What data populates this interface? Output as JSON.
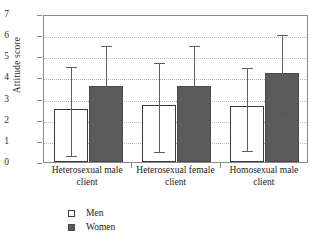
{
  "chart_data": {
    "type": "bar",
    "title": "",
    "xlabel": "",
    "ylabel": "Attitude score",
    "ylim": [
      0,
      7
    ],
    "yticks": [
      0,
      1,
      2,
      3,
      4,
      5,
      6,
      7
    ],
    "grid": true,
    "legend_position": "bottom-left",
    "error_bar_style": "capped-vertical",
    "categories": [
      "Heterosexual male client",
      "Heterosexual female client",
      "Homosexual male client"
    ],
    "series": [
      {
        "name": "Men",
        "color": "#ffffff",
        "values": [
          2.5,
          2.7,
          2.65
        ],
        "err_low": [
          0.4,
          0.55,
          0.6
        ],
        "err_high": [
          4.6,
          4.8,
          4.55
        ]
      },
      {
        "name": "Women",
        "color": "#5a5a5a",
        "values": [
          3.6,
          3.6,
          4.2
        ],
        "err_low": [
          1.55,
          1.55,
          2.15
        ],
        "err_high": [
          5.6,
          5.6,
          6.1
        ]
      }
    ]
  },
  "legend": {
    "items": [
      {
        "label": "Men",
        "swatch": "open-square-icon"
      },
      {
        "label": "Women",
        "swatch": "filled-square-icon"
      }
    ]
  },
  "axes": {
    "y_title": "Attitude score",
    "y_tick_labels": [
      "0",
      "1",
      "2",
      "3",
      "4",
      "5",
      "6",
      "7"
    ]
  }
}
